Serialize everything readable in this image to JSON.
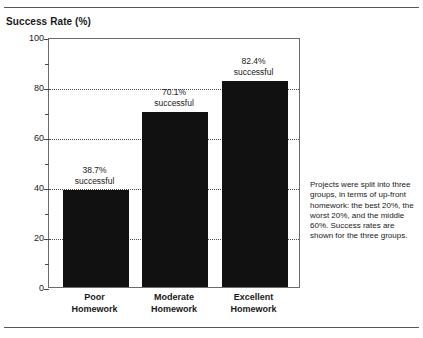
{
  "chart_data": {
    "type": "bar",
    "title": "Success Rate (%)",
    "xlabel": "",
    "ylabel": "Success Rate (%)",
    "ylim": [
      0,
      100
    ],
    "ytick_step_major": 20,
    "ytick_step_minor": 10,
    "ytick_labels": [
      "0",
      "20",
      "40",
      "60",
      "80",
      "100"
    ],
    "ytick_values": [
      0,
      20,
      40,
      60,
      80,
      100
    ],
    "gridlines_at": [
      20,
      40,
      60,
      80
    ],
    "grid": true,
    "legend": "none",
    "bar_color": "#111111",
    "categories": [
      "Poor Homework",
      "Moderate Homework",
      "Excellent Homework"
    ],
    "category_lines": [
      [
        "Poor",
        "Homework"
      ],
      [
        "Moderate",
        "Homework"
      ],
      [
        "Excellent",
        "Homework"
      ]
    ],
    "values": [
      38.7,
      70.1,
      82.4
    ],
    "data_labels": [
      [
        "38.7%",
        "successful"
      ],
      [
        "70.1%",
        "successful"
      ],
      [
        "82.4%",
        "successful"
      ]
    ],
    "annotation": "Projects were split into three groups, in terms of up-front homework: the best 20%, the worst 20%, and the middle 60%. Success rates are shown for the three groups."
  }
}
